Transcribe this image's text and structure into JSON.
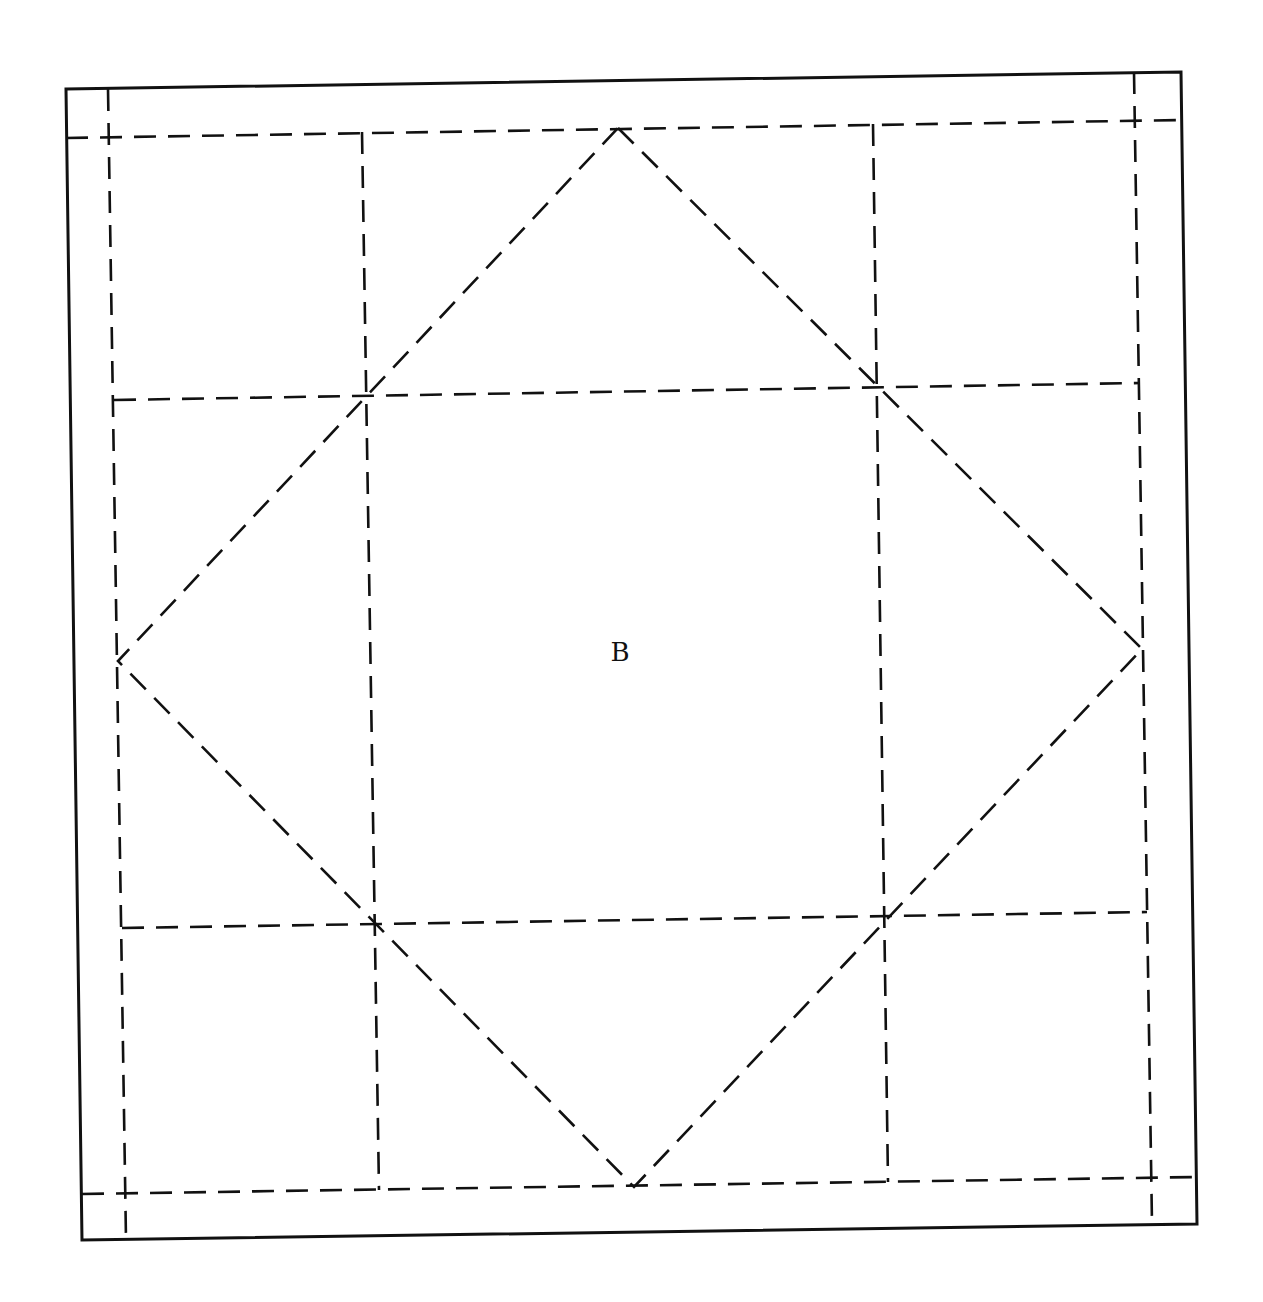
{
  "page": {
    "background": "#ffffff",
    "ink_color": "#111111"
  },
  "diagram": {
    "title_label": "B",
    "label_position": [
      620,
      661
    ],
    "outer_border": [
      [
        66,
        89
      ],
      [
        1181,
        72
      ],
      [
        1197,
        1224
      ],
      [
        82,
        1240
      ]
    ],
    "seam_lines_horizontal": [
      [
        [
          66,
          138
        ],
        [
          1181,
          120
        ]
      ],
      [
        [
          114,
          400
        ],
        [
          1140,
          383
        ]
      ],
      [
        [
          122,
          928
        ],
        [
          1147,
          912
        ]
      ],
      [
        [
          82,
          1194
        ],
        [
          1197,
          1177
        ]
      ]
    ],
    "seam_lines_vertical": [
      [
        [
          108,
          89
        ],
        [
          126,
          1240
        ]
      ],
      [
        [
          362,
          132
        ],
        [
          379,
          1190
        ]
      ],
      [
        [
          873,
          124
        ],
        [
          888,
          1182
        ]
      ],
      [
        [
          1134,
          72
        ],
        [
          1152,
          1224
        ]
      ]
    ],
    "diamond": [
      [
        618,
        128
      ],
      [
        1142,
        649
      ],
      [
        634,
        1187
      ],
      [
        118,
        661
      ]
    ]
  }
}
